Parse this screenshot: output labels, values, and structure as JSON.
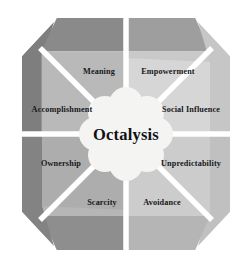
{
  "diagram": {
    "title": "Octalysis",
    "type": "octagon-framework",
    "center": {
      "label": "Octalysis"
    },
    "geometry": {
      "center_x": 126,
      "center_y": 134,
      "outer_radius": 116,
      "rim_inner_radius": 96,
      "inner_radius": 44,
      "divider_color": "#ffffff",
      "background": "#ffffff"
    },
    "segments": [
      {
        "id": "empowerment",
        "label": "Empowerment",
        "position": "top-right",
        "index": 0,
        "rim_color": "#9e9e9e",
        "fill_color": "#c9c9c9",
        "label_x": 168,
        "label_y": 74,
        "label_anchor": "middle"
      },
      {
        "id": "social-influence",
        "label": "Social Influence",
        "position": "right-upper",
        "index": 1,
        "rim_color": "#c6c6c6",
        "fill_color": "#d6d6d6",
        "label_x": 192,
        "label_y": 112,
        "label_anchor": "middle"
      },
      {
        "id": "unpredictability",
        "label": "Unpredictability",
        "position": "right-lower",
        "index": 2,
        "rim_color": "#c0c0c0",
        "fill_color": "#cfcfcf",
        "label_x": 192,
        "label_y": 165,
        "label_anchor": "middle"
      },
      {
        "id": "avoidance",
        "label": "Avoidance",
        "position": "bottom-right",
        "index": 3,
        "rim_color": "#b5b5b5",
        "fill_color": "#cccccc",
        "label_x": 162,
        "label_y": 205,
        "label_anchor": "middle"
      },
      {
        "id": "scarcity",
        "label": "Scarcity",
        "position": "bottom-left",
        "index": 4,
        "rim_color": "#8e8e8e",
        "fill_color": "#b6b6b6",
        "label_x": 102,
        "label_y": 205,
        "label_anchor": "middle"
      },
      {
        "id": "ownership",
        "label": "Ownership",
        "position": "left-lower",
        "index": 5,
        "rim_color": "#838383",
        "fill_color": "#adadad",
        "label_x": 60,
        "label_y": 165,
        "label_anchor": "middle"
      },
      {
        "id": "accomplishment",
        "label": "Accomplishment",
        "position": "left-upper",
        "index": 6,
        "rim_color": "#7e7e7e",
        "fill_color": "#adadad",
        "label_x": 62,
        "label_y": 112,
        "label_anchor": "middle"
      },
      {
        "id": "meaning",
        "label": "Meaning",
        "position": "top-left",
        "index": 7,
        "rim_color": "#8a8a8a",
        "fill_color": "#b9b9b9",
        "label_x": 99,
        "label_y": 74,
        "label_anchor": "middle"
      }
    ]
  }
}
